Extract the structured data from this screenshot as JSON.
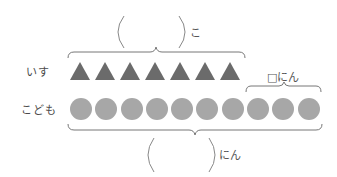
{
  "rows": {
    "chairs": {
      "label": "いす",
      "count": 7,
      "shape": "triangle",
      "color": "#6b6b6b"
    },
    "children": {
      "label": "こども",
      "count": 10,
      "shape": "circle",
      "color": "#a7a7a7"
    }
  },
  "top_brace": {
    "blank": "(      )",
    "unit": "こ"
  },
  "right_brace": {
    "label": "□にん"
  },
  "bottom_brace": {
    "blank": "(      )",
    "unit": "にん"
  }
}
